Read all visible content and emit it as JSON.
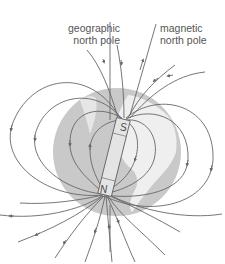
{
  "diagram": {
    "labels": {
      "geographic_line1": "geographic",
      "geographic_line2": "north pole",
      "magnetic_line1": "magnetic",
      "magnetic_line2": "north pole"
    },
    "magnet": {
      "top_pole": "S",
      "bottom_pole": "N"
    },
    "colors": {
      "globe": "#c9c9c9",
      "continent": "#f2f2f2",
      "field_line": "#666666",
      "magnet": "#e4e4e4",
      "text": "#555555"
    }
  }
}
